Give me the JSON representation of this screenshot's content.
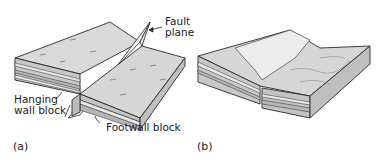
{
  "figure": {
    "panels": [
      {
        "id": "a",
        "label": "(a)",
        "annotations": {
          "fault_plane_line1": "Fault",
          "fault_plane_line2": "plane",
          "hanging_wall_line1": "Hanging",
          "hanging_wall_line2": "wall block",
          "footwall": "Footwall block"
        }
      },
      {
        "id": "b",
        "label": "(b)"
      }
    ],
    "colors": {
      "top_surface": "#d9d9d9",
      "side_face": "#c4c4c4",
      "stratum_light": "#e6e6e6",
      "stratum_dark": "#b0b0b0",
      "outline": "#2a2a2a",
      "fault_plane": "#f2f2f2",
      "eroded_surface": "#ebebeb"
    }
  }
}
